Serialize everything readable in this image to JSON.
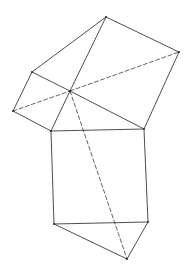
{
  "diagram": {
    "type": "geometric-figure",
    "stroke_color": "#3a3a3a",
    "background": "#ffffff",
    "vertices": {
      "top": [
        106,
        17
      ],
      "right": [
        179,
        52
      ],
      "upper_left": [
        32,
        72
      ],
      "far_left": [
        13,
        111
      ],
      "center": [
        70,
        91
      ],
      "square_top_left": [
        51,
        131
      ],
      "square_top_right": [
        144,
        129
      ],
      "square_bottom_left": [
        54,
        224
      ],
      "square_bottom_right": [
        148,
        222
      ],
      "bottom": [
        127,
        259
      ]
    },
    "solid_edges": [
      [
        "upper_left",
        "top"
      ],
      [
        "top",
        "right"
      ],
      [
        "right",
        "square_top_right"
      ],
      [
        "top",
        "center"
      ],
      [
        "upper_left",
        "center"
      ],
      [
        "center",
        "square_top_right"
      ],
      [
        "upper_left",
        "far_left"
      ],
      [
        "far_left",
        "square_top_left"
      ],
      [
        "center",
        "square_top_left"
      ],
      [
        "square_top_left",
        "square_top_right"
      ],
      [
        "square_top_left",
        "square_bottom_left"
      ],
      [
        "square_top_right",
        "square_bottom_right"
      ],
      [
        "square_bottom_left",
        "square_bottom_right"
      ],
      [
        "square_bottom_left",
        "bottom"
      ],
      [
        "square_bottom_right",
        "bottom"
      ]
    ],
    "dashed_edges": [
      [
        "far_left",
        "center"
      ],
      [
        "center",
        "right"
      ],
      [
        "center",
        "bottom"
      ]
    ]
  }
}
